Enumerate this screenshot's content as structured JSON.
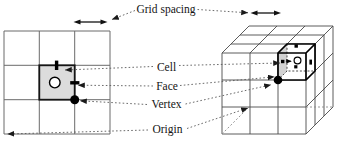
{
  "figure": {
    "labels": {
      "grid_spacing": "Grid spacing",
      "cell": "Cell",
      "face": "Face",
      "vertex": "Vertex",
      "origin": "Origin"
    },
    "colors": {
      "background": "#ffffff",
      "grid_line_2d": "#6b6b6b",
      "grid_line_3d": "#4a4a4a",
      "shaded_cell": "#dcdcdc",
      "shaded_face": "#d2d2d2",
      "marker": "#000000",
      "leader_line": "#5a5a5a"
    }
  }
}
